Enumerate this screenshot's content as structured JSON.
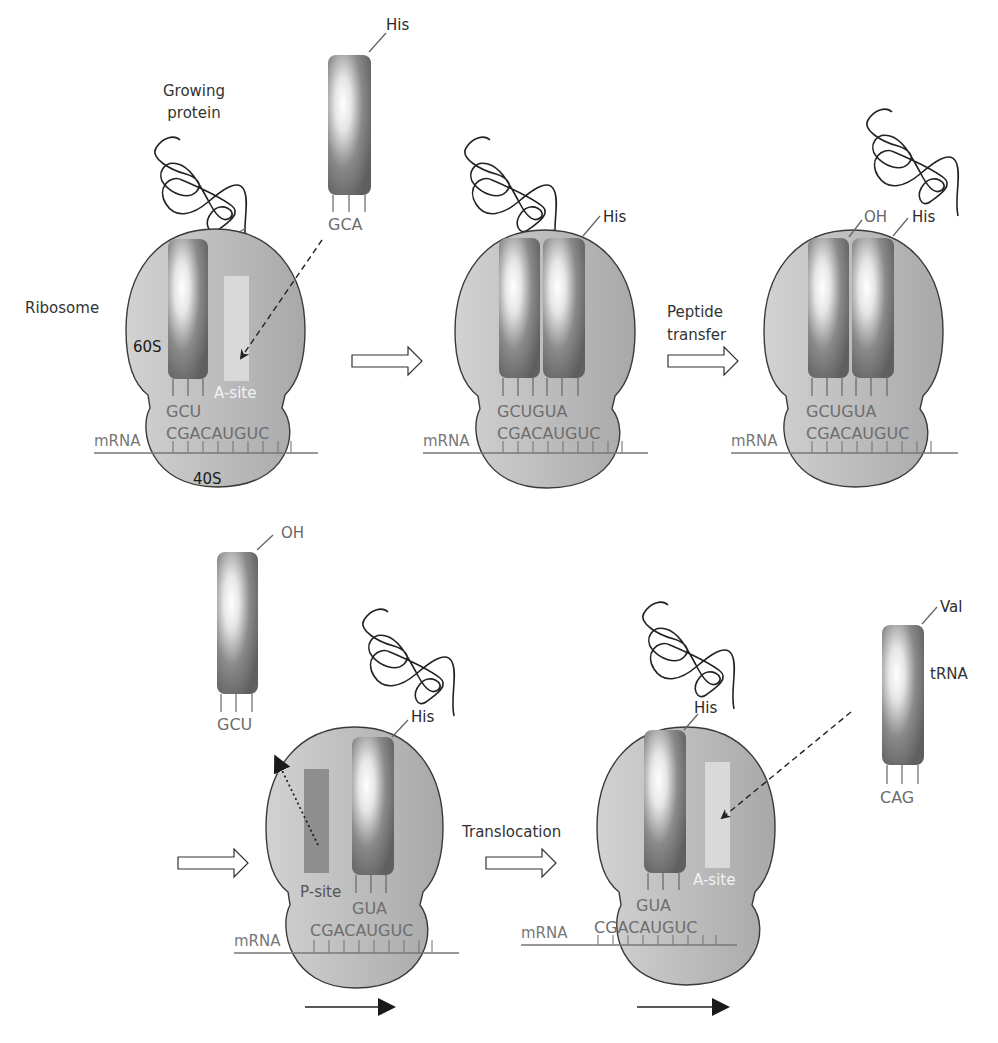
{
  "labels": {
    "growing_protein_line1": "Growing",
    "growing_protein_line2": "protein",
    "ribosome": "Ribosome",
    "large_subunit": "60S",
    "small_subunit": "40S",
    "mrna": "mRNA",
    "a_site": "A-site",
    "p_site": "P-site",
    "trna": "tRNA",
    "peptide_transfer_line1": "Peptide",
    "peptide_transfer_line2": "transfer",
    "translocation": "Translocation"
  },
  "amino_acids": {
    "his": "His",
    "val": "Val",
    "oh": "OH"
  },
  "codons": {
    "mrna_sequence": "CGACAUGUC",
    "anticodon_gcu": "GCU",
    "anticodon_gca": "GCA",
    "anticodon_gua": "GUA",
    "anticodon_pair": "GCUGUA",
    "anticodon_cag": "CAG"
  },
  "colors": {
    "ribosome_body": "#bdbdbd",
    "ribosome_outline": "#3a3a3a",
    "trna_dark": "#6a6a6a",
    "a_site_fill": "#d9d9d9",
    "p_site_fill": "#8e8e8e",
    "mrna_line": "#777777"
  },
  "steps": [
    {
      "id": "step-1",
      "description": "Ribosome with tRNA-GCU in P-site; His-tRNA (GCA) approaching A-site"
    },
    {
      "id": "step-2",
      "description": "His-tRNA bound at A-site"
    },
    {
      "id": "step-3",
      "description": "Peptide transfer"
    },
    {
      "id": "step-4",
      "description": "Empty tRNA (GCU-OH) leaves P-site"
    },
    {
      "id": "step-5",
      "description": "Translocation; Val-tRNA (CAG) approaches A-site"
    }
  ]
}
